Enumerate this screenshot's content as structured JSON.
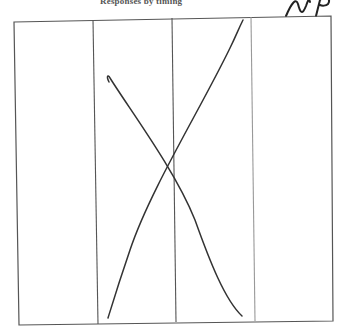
{
  "header": {
    "title": "Responses by timing"
  },
  "annotation": {
    "initials": "NP"
  },
  "table": {
    "columns": 4,
    "rows": 1,
    "cells": [
      "",
      "",
      "",
      ""
    ],
    "strike_through": "X drawn across columns 2 and 3"
  },
  "colors": {
    "ink": "#333333",
    "grid": "#555555",
    "background": "#ffffff"
  }
}
